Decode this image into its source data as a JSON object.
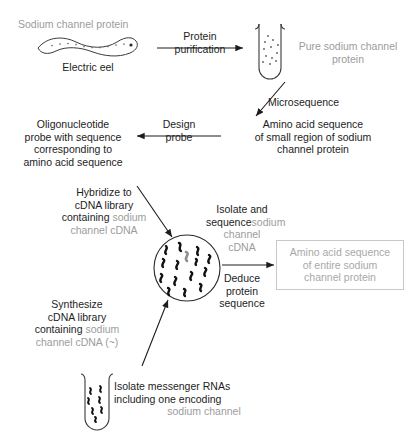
{
  "figure": {
    "title_top_left": "Sodium channel protein",
    "source_label": "Electric eel"
  },
  "steps": {
    "protein_purification": "Protein\npurification",
    "pure_protein": "Pure sodium channel\nprotein",
    "microsequence": "Microsequence",
    "amino_acid_small_region": "Amino acid sequence\nof small region of sodium\nchannel protein",
    "design_probe": "Design\nprobe",
    "oligo_probe": "Oligonucleotide\nprobe with sequence\ncorresponding to\namino acid sequence",
    "hybridize_black": "Hybridize to\ncDNA library\ncontaining ",
    "hybridize_gray": "sodium\nchannel cDNA",
    "isolate_sequence_black": "Isolate and\nsequence",
    "isolate_sequence_gray": "sodium\nchannel\ncDNA",
    "deduce_protein_sequence": "Deduce\nprotein\nsequence",
    "amino_acid_entire": "Amino acid sequence\nof entire sodium\nchannel protein",
    "synthesize_black": "Synthesize\ncDNA library\ncontaining ",
    "synthesize_gray": "sodium\nchannel cDNA (~)",
    "isolate_mrna_black": "Isolate messenger RNAs\nincluding one encoding",
    "isolate_mrna_gray": "sodium channel"
  },
  "colors": {
    "ink": "#1d1d1d",
    "gray_text": "#9c9c9c",
    "box_border": "#c9c9c9",
    "target_cdna": "#8f8f8f"
  },
  "icons": {
    "eel": "electric-eel",
    "tube_top": "test-tube-purified-protein",
    "tube_bottom": "test-tube-mrna",
    "library": "cdna-library-circle"
  }
}
